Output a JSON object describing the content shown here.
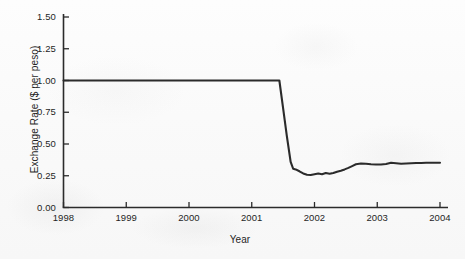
{
  "chart_data": {
    "type": "line",
    "title": "",
    "xlabel": "Year",
    "ylabel": "Exchange Rate ($ per peso)",
    "xlim": [
      1998,
      2004
    ],
    "ylim": [
      0.0,
      1.5
    ],
    "grid": false,
    "legend": "none",
    "x_ticks": [
      "1998",
      "1999",
      "2000",
      "2001",
      "2002",
      "2003",
      "2004"
    ],
    "x_tick_values": [
      1998,
      1999,
      2000,
      2001,
      2002,
      2003,
      2004
    ],
    "y_ticks": [
      "0.00",
      "0.25",
      "0.50",
      "0.75",
      "1.00",
      "1.25",
      "1.50"
    ],
    "y_tick_values": [
      0.0,
      0.25,
      0.5,
      0.75,
      1.0,
      1.25,
      1.5
    ],
    "line_color": "#2b2b2b",
    "line_width": 2.1,
    "series": [
      {
        "name": "Exchange Rate ($ per peso)",
        "x": [
          1998.0,
          1998.25,
          1998.5,
          1998.75,
          1999.0,
          1999.25,
          1999.5,
          1999.75,
          2000.0,
          2000.25,
          2000.5,
          2000.75,
          2001.0,
          2001.2,
          2001.35,
          2001.44,
          2001.5,
          2001.56,
          2001.62,
          2001.66,
          2001.7,
          2001.76,
          2001.82,
          2001.88,
          2001.94,
          2002.0,
          2002.06,
          2002.12,
          2002.18,
          2002.24,
          2002.3,
          2002.36,
          2002.42,
          2002.48,
          2002.54,
          2002.6,
          2002.66,
          2002.74,
          2002.82,
          2002.9,
          2002.98,
          2003.06,
          2003.14,
          2003.22,
          2003.3,
          2003.38,
          2003.46,
          2003.54,
          2003.62,
          2003.7,
          2003.78,
          2003.86,
          2003.94,
          2004.0
        ],
        "y": [
          1.0,
          1.0,
          1.0,
          1.0,
          1.0,
          1.0,
          1.0,
          1.0,
          1.0,
          1.0,
          1.0,
          1.0,
          1.0,
          1.0,
          1.0,
          1.0,
          0.78,
          0.56,
          0.36,
          0.305,
          0.3,
          0.285,
          0.268,
          0.258,
          0.256,
          0.262,
          0.268,
          0.262,
          0.272,
          0.266,
          0.272,
          0.282,
          0.29,
          0.3,
          0.312,
          0.326,
          0.34,
          0.346,
          0.344,
          0.34,
          0.338,
          0.338,
          0.342,
          0.352,
          0.348,
          0.344,
          0.346,
          0.348,
          0.35,
          0.35,
          0.352,
          0.352,
          0.352,
          0.352
        ]
      }
    ],
    "annotations": []
  }
}
